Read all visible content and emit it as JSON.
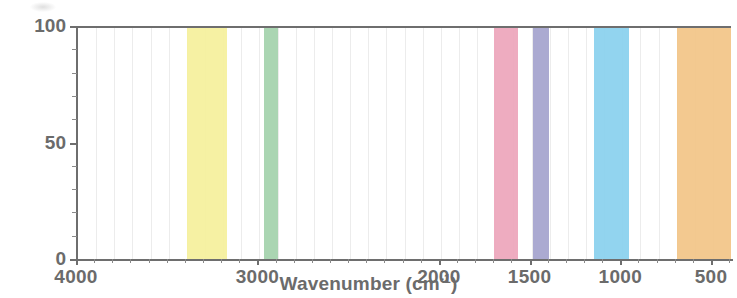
{
  "chart_data": {
    "type": "area",
    "title": "",
    "subtitle": "",
    "xlabel_text": "Wavenumber (cm",
    "xlabel_sup": "-1",
    "xlabel_close": ")",
    "xlabel_full": "Wavenumber (cm-1)",
    "ylabel": "",
    "xlim": [
      4000,
      390
    ],
    "ylim": [
      0,
      100
    ],
    "x_reversed": true,
    "grid": true,
    "grid_axis": "x",
    "legend": "none",
    "x_ticks": [
      4000,
      3000,
      2000,
      1500,
      1000,
      500
    ],
    "x_tick_labels": [
      "4000",
      "3000",
      "2000",
      "1500",
      "1000",
      "500"
    ],
    "y_ticks": [
      0,
      50,
      100
    ],
    "y_tick_labels": [
      "0",
      "50",
      "100"
    ],
    "y_minor_tick_count": 10,
    "bands": [
      {
        "name": "band-yellow",
        "color": "#f5f09e",
        "x_start": 3400,
        "x_end": 3180,
        "y_start": 0,
        "y_end": 100
      },
      {
        "name": "band-green",
        "color": "#a5d3ae",
        "x_start": 2975,
        "x_end": 2900,
        "y_start": 0,
        "y_end": 100
      },
      {
        "name": "band-pink",
        "color": "#eda8bd",
        "x_start": 1705,
        "x_end": 1575,
        "y_start": 0,
        "y_end": 100
      },
      {
        "name": "band-purple",
        "color": "#a6a5cf",
        "x_start": 1490,
        "x_end": 1405,
        "y_start": 0,
        "y_end": 100
      },
      {
        "name": "band-blue",
        "color": "#8cd2ee",
        "x_start": 1155,
        "x_end": 965,
        "y_start": 0,
        "y_end": 100
      },
      {
        "name": "band-orange",
        "color": "#f2c68a",
        "x_start": 700,
        "x_end": 390,
        "y_start": 0,
        "y_end": 100
      }
    ]
  },
  "axis": {
    "line_color": "#6e6e6e",
    "tick_label_color": "#6b6b6b",
    "gridline_color": "#ececec"
  }
}
